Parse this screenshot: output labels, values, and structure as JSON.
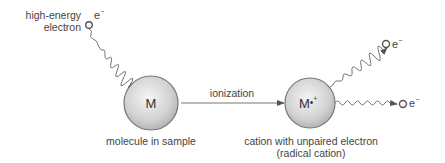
{
  "diagram": {
    "incoming_electron": {
      "label_line1": "high-energy",
      "label_line2": "electron",
      "symbol": "e",
      "charge": "−"
    },
    "molecule": {
      "symbol": "M",
      "caption": "molecule in sample"
    },
    "process": {
      "label": "ionization"
    },
    "cation": {
      "symbol": "M",
      "radical_dot": "•",
      "charge": "+",
      "caption_line1": "cation with unpaired electron",
      "caption_line2": "(radical cation)"
    },
    "outgoing_electrons": [
      {
        "symbol": "e",
        "charge": "−"
      },
      {
        "symbol": "e",
        "charge": "−"
      }
    ],
    "colors": {
      "sphere_center": "#f2f2f2",
      "sphere_edge": "#b8b8b8",
      "stroke": "#666666",
      "text": "#444444"
    }
  }
}
